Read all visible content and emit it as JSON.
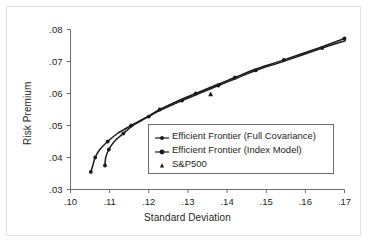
{
  "chart_data": {
    "type": "line",
    "title": "",
    "xlabel": "Standard Deviation",
    "ylabel": "Risk Premium",
    "xlim": [
      0.1,
      0.17
    ],
    "ylim": [
      0.03,
      0.08
    ],
    "xticks": [
      ".10",
      ".11",
      ".12",
      ".13",
      ".14",
      ".15",
      ".16",
      ".17"
    ],
    "xtick_values": [
      0.1,
      0.11,
      0.12,
      0.13,
      0.14,
      0.15,
      0.16,
      0.17
    ],
    "yticks": [
      ".03",
      ".04",
      ".05",
      ".06",
      ".07",
      ".08"
    ],
    "ytick_values": [
      0.03,
      0.04,
      0.05,
      0.06,
      0.07,
      0.08
    ],
    "grid": false,
    "legend_position": "center-right",
    "series": [
      {
        "name": "Efficient Frontier (Full Covariance)",
        "marker": "line-dot",
        "x": [
          0.1052,
          0.1057,
          0.1063,
          0.1075,
          0.1095,
          0.112,
          0.1155,
          0.12,
          0.1228,
          0.128,
          0.132,
          0.1375,
          0.142,
          0.147,
          0.1545,
          0.164,
          0.17
        ],
        "y": [
          0.0355,
          0.0375,
          0.04,
          0.0425,
          0.045,
          0.0475,
          0.05,
          0.053,
          0.055,
          0.058,
          0.06,
          0.0628,
          0.065,
          0.0675,
          0.0705,
          0.0745,
          0.0772
        ]
      },
      {
        "name": "Efficient Frontier (Index Model)",
        "marker": "line-dot",
        "x": [
          0.1088,
          0.109,
          0.1098,
          0.1112,
          0.1135,
          0.116,
          0.12,
          0.123,
          0.1285,
          0.1325,
          0.1378,
          0.1423,
          0.1473,
          0.1548,
          0.1643,
          0.1702
        ],
        "y": [
          0.0375,
          0.04,
          0.0425,
          0.045,
          0.0475,
          0.05,
          0.0528,
          0.0548,
          0.0578,
          0.0598,
          0.0625,
          0.0647,
          0.0672,
          0.0702,
          0.0742,
          0.0765
        ]
      }
    ],
    "points": [
      {
        "name": "S&P500",
        "marker": "triangle",
        "x": [
          0.1358
        ],
        "y": [
          0.0598
        ]
      }
    ],
    "legend_entries": [
      {
        "label": "Efficient Frontier (Full Covariance)",
        "marker": "line-dot"
      },
      {
        "label": "Efficient Frontier (Index Model)",
        "marker": "line-dot"
      },
      {
        "label": "S&P500",
        "marker": "triangle"
      }
    ],
    "colors": {
      "line": "#1a1a1a",
      "axis": "#6d6d6d",
      "text": "#231f20",
      "background": "#ffffff",
      "frame": "#e2e2e2"
    }
  }
}
